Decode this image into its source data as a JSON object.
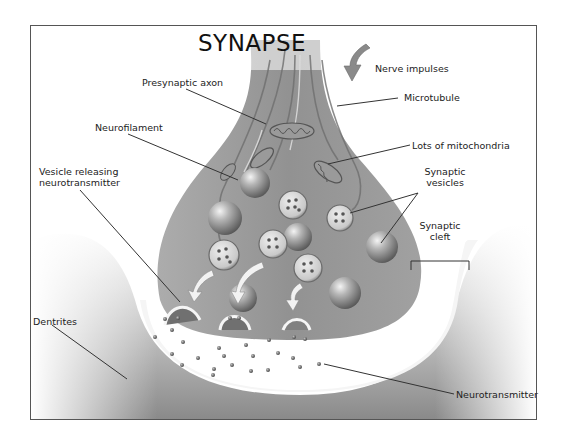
{
  "diagram": {
    "title": "SYNAPSE",
    "labels": {
      "nerve_impulses": "Nerve impulses",
      "presynaptic_axon": "Presynaptic axon",
      "microtubule": "Microtubule",
      "neurofilament": "Neurofilament",
      "lots_of_mitochondria": "Lots of mitochondria",
      "vesicle_releasing_line1": "Vesicle releasing",
      "vesicle_releasing_line2": "neurotransmitter",
      "synaptic_vesicles_line1": "Synaptic",
      "synaptic_vesicles_line2": "vesicles",
      "synaptic_cleft_line1": "Synaptic",
      "synaptic_cleft_line2": "cleft",
      "dentrites": "Dentrites",
      "neurotransmitter": "Neurotransmitter"
    },
    "colors": {
      "axon_fill": "#8f8f8f",
      "axon_dark": "#7a7a7a",
      "dendrite_fill": "#9a9a9a",
      "cleft_fill": "#ffffff",
      "leader_line": "#333333",
      "frame": "#555555"
    }
  }
}
